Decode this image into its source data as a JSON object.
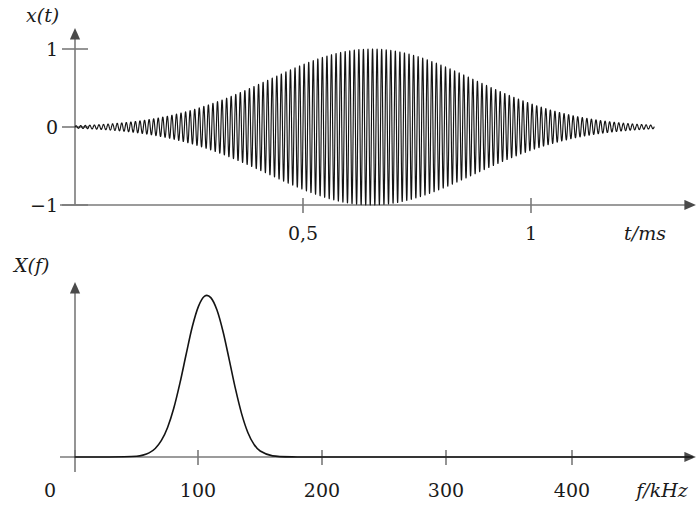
{
  "figure": {
    "background_color": "#ffffff",
    "axis_color": "#7a7a7a",
    "curve_color": "#141414",
    "text_color": "#1a1a1a"
  },
  "top_plot": {
    "y_axis_label": "x(t)",
    "x_axis_label": "t/ms",
    "y_ticks": [
      {
        "value": 1,
        "label": "1"
      },
      {
        "value": 0,
        "label": "0"
      },
      {
        "value": -1,
        "label": "−1"
      }
    ],
    "x_ticks": [
      {
        "value": 0.5,
        "label": "0,5"
      },
      {
        "value": 1,
        "label": "1"
      }
    ]
  },
  "bottom_plot": {
    "y_axis_label": "X(f)",
    "x_axis_label": "f/kHz",
    "x_ticks": [
      {
        "value": 0,
        "label": "0"
      },
      {
        "value": 100,
        "label": "100"
      },
      {
        "value": 200,
        "label": "200"
      },
      {
        "value": 300,
        "label": "300"
      },
      {
        "value": 400,
        "label": "400"
      }
    ]
  },
  "chart_data": [
    {
      "type": "line",
      "id": "time-domain-signal",
      "title": "",
      "xlabel": "t/ms",
      "ylabel": "x(t)",
      "xlim": [
        0,
        1.27
      ],
      "ylim": [
        -1.1,
        1.1
      ],
      "grid": false,
      "legend": "none",
      "description": "Amplitude-modulated burst: a ~100 kHz sinusoidal carrier with a smooth bell-shaped (Gaussian) envelope peaking near t = 0.65 ms.",
      "carrier_frequency_khz": 100,
      "envelope": {
        "shape": "gaussian",
        "center_ms": 0.65,
        "sigma_ms": 0.225,
        "peak_amplitude": 1.0
      },
      "x_tick_values": [
        0.5,
        1
      ],
      "x_tick_labels": [
        "0,5",
        "1"
      ],
      "y_tick_values": [
        1,
        0,
        -1
      ],
      "y_tick_labels": [
        "1",
        "0",
        "−1"
      ]
    },
    {
      "type": "line",
      "id": "magnitude-spectrum",
      "title": "",
      "xlabel": "f/kHz",
      "ylabel": "X(f)",
      "xlim": [
        0,
        500
      ],
      "ylim": [
        0,
        1.1
      ],
      "grid": false,
      "legend": "none",
      "description": "Magnitude spectrum of the burst: a single Gaussian lobe centred at 100 kHz, essentially zero outside roughly 60–145 kHz.",
      "peak_frequency_khz": 100,
      "peak_value": 1.0,
      "half_width_khz": 17,
      "gaussian_sigma_khz": 14.5,
      "x_tick_values": [
        0,
        100,
        200,
        300,
        400
      ],
      "x_tick_labels": [
        "0",
        "100",
        "200",
        "300",
        "400"
      ],
      "points_khz": [
        0,
        20,
        40,
        50,
        55,
        60,
        65,
        70,
        75,
        80,
        85,
        90,
        95,
        100,
        105,
        110,
        115,
        120,
        125,
        130,
        135,
        140,
        145,
        150,
        160,
        180,
        200,
        250,
        300,
        350,
        400,
        450,
        500
      ],
      "points_value": [
        0,
        0,
        0.001,
        0.004,
        0.01,
        0.022,
        0.046,
        0.089,
        0.159,
        0.262,
        0.397,
        0.551,
        0.7,
        0.81,
        0.865,
        0.857,
        0.79,
        0.672,
        0.521,
        0.366,
        0.232,
        0.132,
        0.068,
        0.032,
        0.006,
        0,
        0,
        0,
        0,
        0,
        0,
        0,
        0
      ]
    }
  ]
}
